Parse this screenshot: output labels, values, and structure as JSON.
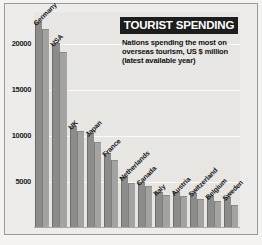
{
  "title": "TOURIST SPENDING",
  "subtitle_lines": [
    "Nations spending the most on",
    "overseas tourism, US $ million",
    "(latest available year)"
  ],
  "colors": {
    "title_background": "#1d1d1d",
    "title_text": "#ffffff",
    "plot_background": "#e7e6e3",
    "gridline": "#fbfbfa",
    "bar_primary": "#8c8c8a",
    "bar_secondary": "#a3a3a1",
    "frame": "#9a9a98"
  },
  "chart_data": {
    "type": "bar",
    "title": "TOURIST SPENDING",
    "subtitle": "Nations spending the most on overseas tourism, US $ million (latest available year)",
    "xlabel": "",
    "ylabel": "US $ million",
    "ylim": [
      0,
      23500
    ],
    "grid": true,
    "legend": "none",
    "yticks": [
      5000,
      10000,
      15000,
      20000
    ],
    "ytick_labels": [
      "5000",
      "10000",
      "15000",
      "20000"
    ],
    "categories": [
      "Germany",
      "USA",
      "UK",
      "Japan",
      "France",
      "Netherlands",
      "Canada",
      "Italy",
      "Austria",
      "Switzerland",
      "Belgium",
      "Sweden"
    ],
    "series": [
      {
        "name": "Series 1",
        "values": [
          22300,
          20000,
          11000,
          10200,
          8000,
          5400,
          4900,
          3800,
          3800,
          3700,
          3400,
          3300
        ]
      },
      {
        "name": "Series 2",
        "values": [
          21500,
          19000,
          10400,
          9300,
          7300,
          4800,
          4500,
          3500,
          3400,
          3100,
          2800,
          2400
        ]
      }
    ]
  }
}
